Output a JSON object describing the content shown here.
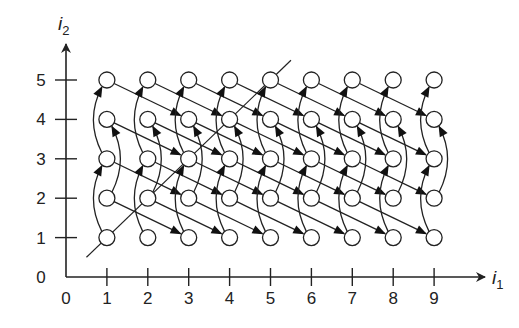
{
  "diagram": {
    "type": "iteration-space-dependence-graph",
    "x_axis": {
      "label": "i",
      "label_sub": "1",
      "ticks": [
        "0",
        "1",
        "2",
        "3",
        "4",
        "5",
        "6",
        "7",
        "8",
        "9"
      ]
    },
    "y_axis": {
      "label": "i",
      "label_sub": "2",
      "ticks": [
        "0",
        "1",
        "2",
        "3",
        "4",
        "5"
      ]
    },
    "grid": {
      "i1_range": [
        1,
        9
      ],
      "i2_range": [
        1,
        5
      ]
    },
    "dependence_vectors": [
      {
        "name": "vertical-arc",
        "d": [
          0,
          2
        ]
      },
      {
        "name": "diagonal-line",
        "d": [
          2,
          -1
        ]
      }
    ],
    "hyperplane_line": {
      "from": [
        0.5,
        0.5
      ],
      "to": [
        5.5,
        5.5
      ]
    },
    "colors": {
      "stroke": "#222222",
      "node_fill": "#ffffff",
      "background": "#ffffff"
    }
  }
}
